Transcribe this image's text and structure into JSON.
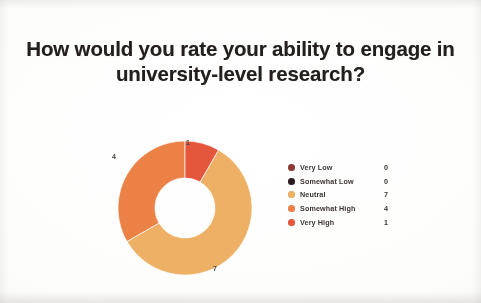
{
  "slide": {
    "title": "How would you rate your ability to engage in university-level research?",
    "background_color": "#fbfbfa",
    "title_color": "#231f1e"
  },
  "chart_data": {
    "type": "pie",
    "variant": "donut",
    "title": "How would you rate your ability to engage in university-level research?",
    "xlabel": "",
    "ylabel": "",
    "categories": [
      "Very Low",
      "Somewhat Low",
      "Neutral",
      "Somewhat High",
      "Very High"
    ],
    "values": [
      0,
      0,
      7,
      4,
      1
    ],
    "colors": [
      "#8c3a32",
      "#2d1b22",
      "#efb061",
      "#ef8044",
      "#e8563a"
    ],
    "total": 12,
    "legend_position": "right",
    "grid": false,
    "data_labels": [
      {
        "label": "1",
        "category": "Very High",
        "value": 1
      },
      {
        "label": "4",
        "category": "Somewhat High",
        "value": 4
      },
      {
        "label": "7",
        "category": "Neutral",
        "value": 7
      }
    ],
    "slices": [
      {
        "name": "Very Low",
        "value": 0,
        "color": "#8c3a32",
        "start_angle": 0,
        "sweep": 0
      },
      {
        "name": "Somewhat Low",
        "value": 0,
        "color": "#2d1b22",
        "start_angle": 0,
        "sweep": 0
      },
      {
        "name": "Neutral",
        "value": 7,
        "color": "#efb061",
        "start_angle": 30,
        "sweep": 210
      },
      {
        "name": "Somewhat High",
        "value": 4,
        "color": "#ef8044",
        "start_angle": 240,
        "sweep": 120
      },
      {
        "name": "Very High",
        "value": 1,
        "color": "#e8563a",
        "start_angle": 0,
        "sweep": 30
      }
    ]
  },
  "legend": {
    "rows": [
      {
        "label": "Very Low",
        "value": "0",
        "color": "#8c3a32"
      },
      {
        "label": "Somewhat Low",
        "value": "0",
        "color": "#2d1b22"
      },
      {
        "label": "Neutral",
        "value": "7",
        "color": "#efb061"
      },
      {
        "label": "Somewhat High",
        "value": "4",
        "color": "#ef8044"
      },
      {
        "label": "Very High",
        "value": "1",
        "color": "#e8563a"
      }
    ]
  }
}
